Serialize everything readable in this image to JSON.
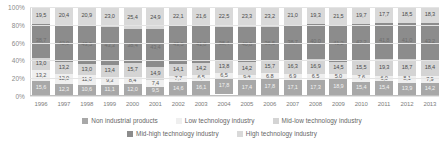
{
  "chart_data": {
    "type": "bar",
    "subtype": "stacked-100-percent",
    "title": "",
    "xlabel": "",
    "ylabel": "",
    "ylim": [
      0,
      100
    ],
    "ytick_labels": [
      "100%",
      "80%",
      "60%",
      "40%",
      "20%",
      "0%"
    ],
    "ytick_values": [
      100,
      80,
      60,
      40,
      20,
      0
    ],
    "grid": true,
    "legend_position": "bottom",
    "categories": [
      "1996",
      "1997",
      "1998",
      "1999",
      "2000",
      "2001",
      "2002",
      "2003",
      "2004",
      "2005",
      "2006",
      "2007",
      "2008",
      "2009",
      "2010",
      "2011",
      "2012",
      "2013"
    ],
    "stack_order_bottom_to_top": [
      "Non industrial products",
      "Low technology industry",
      "Mid-low technology industry",
      "Mid-high technology industry",
      "High technology industry"
    ],
    "series": [
      {
        "name": "High technology industry",
        "color": "#d9d9d9",
        "values": [
          19.5,
          20.4,
          20.9,
          23.0,
          25.4,
          24.9,
          22.1,
          21.6,
          22.5,
          23.3,
          23.2,
          21.0,
          19.3,
          21.5,
          19.7,
          17.7,
          18.5,
          18.3
        ]
      },
      {
        "name": "Mid-high technology industry",
        "color": "#8c8c8c",
        "values": [
          38.7,
          42.0,
          43.5,
          43.3,
          38.4,
          43.4,
          43.5,
          41.8,
          38.4,
          40.8,
          36.5,
          38.7,
          40.0,
          41.2,
          42.2,
          41.8,
          41.0,
          43.2
        ]
      },
      {
        "name": "Mid-low technology industry",
        "color": "#d4d4d4",
        "values": [
          13.0,
          13.2,
          13.0,
          13.4,
          15.7,
          14.9,
          14.1,
          14.2,
          13.8,
          14.2,
          15.7,
          16.3,
          16.9,
          14.5,
          15.5,
          19.3,
          18.7,
          18.4
        ]
      },
      {
        "name": "Low technology industry",
        "color": "#efefef",
        "values": [
          13.2,
          12.0,
          11.6,
          9.3,
          8.4,
          7.4,
          7.7,
          6.5,
          6.5,
          6.4,
          6.8,
          6.9,
          6.5,
          5.0,
          7.6,
          6.0,
          8.1,
          7.9
        ]
      },
      {
        "name": "Non industrial products",
        "color": "#a8a8a8",
        "values": [
          15.6,
          12.3,
          10.6,
          11.1,
          12.0,
          9.5,
          14.6,
          16.1,
          17.8,
          17.4,
          17.8,
          17.1,
          17.3,
          18.9,
          15.4,
          15.4,
          13.9,
          14.2
        ]
      }
    ]
  },
  "legend": {
    "items": [
      {
        "label": "Non industrial products",
        "color": "#a8a8a8"
      },
      {
        "label": "Low technology industry",
        "color": "#efefef"
      },
      {
        "label": "Mid-low technology industry",
        "color": "#d4d4d4"
      },
      {
        "label": "Mid-high technology industry",
        "color": "#8c8c8c"
      },
      {
        "label": "High technology industry",
        "color": "#d9d9d9"
      }
    ]
  }
}
